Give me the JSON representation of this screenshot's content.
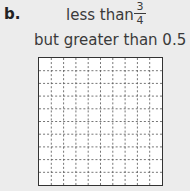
{
  "problem": {
    "label": "b.",
    "condition_line1": "less than",
    "fraction": {
      "numerator": "3",
      "denominator": "4"
    },
    "condition_line2": "but greater than 0.5"
  },
  "grid": {
    "rows": 10,
    "columns": 10,
    "shaded_cells": 0,
    "line_color": "#555555"
  }
}
